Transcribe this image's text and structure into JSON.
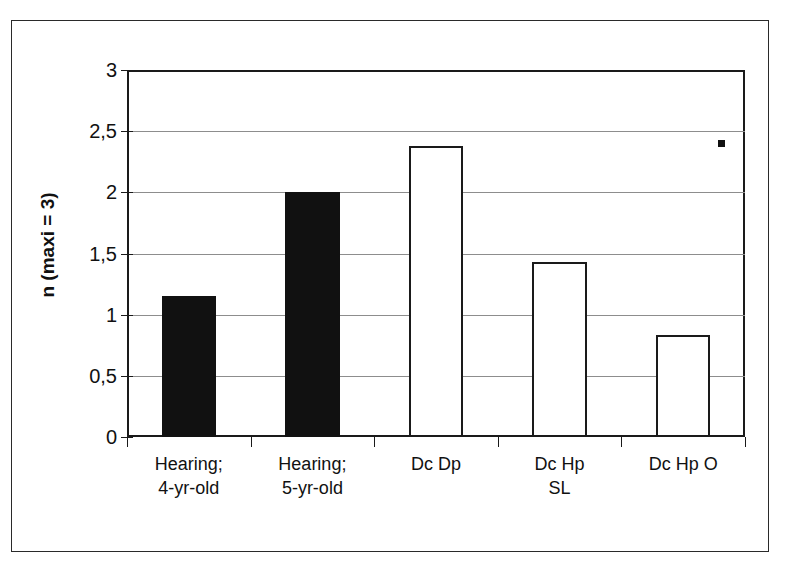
{
  "chart_data": {
    "type": "bar",
    "title": "",
    "xlabel": "",
    "ylabel": "n (maxi = 3)",
    "ylim": [
      0,
      3
    ],
    "ytick_values": [
      0,
      0.5,
      1,
      1.5,
      2,
      2.5,
      3
    ],
    "ytick_labels": [
      "0",
      "0,5",
      "1",
      "1,5",
      "2",
      "2,5",
      "3"
    ],
    "grid": true,
    "legend": "none",
    "categories": [
      "Hearing;\n4-yr-old",
      "Hearing;\n5-yr-old",
      "Dc Dp",
      "Dc Hp\nSL",
      "Dc Hp O"
    ],
    "values": [
      1.15,
      2.0,
      2.38,
      1.43,
      0.83
    ],
    "bar_styles": [
      "filled",
      "filled",
      "hollow",
      "hollow",
      "hollow"
    ],
    "colors": {
      "filled": "#111111",
      "hollow_fill": "#ffffff",
      "outline": "#1a1a1a",
      "gridline": "#8d8d8d",
      "axis": "#1a1a1a",
      "text": "#111111",
      "background": "#ffffff"
    }
  }
}
